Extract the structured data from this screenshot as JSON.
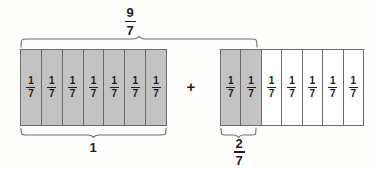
{
  "diagram": {
    "title_label": "9/7",
    "operator": "+",
    "total_brace": {
      "name": "total-span",
      "label_numerator": "9",
      "label_denominator": "7"
    },
    "bars": [
      {
        "name": "bar-left",
        "segments": 7,
        "shaded_count": 7,
        "cell_numerator": "1",
        "cell_denominator": "7",
        "brace_label": "1",
        "brace_label_type": "whole",
        "cells": [
          {
            "numerator": "1",
            "denominator": "7",
            "shaded": true
          },
          {
            "numerator": "1",
            "denominator": "7",
            "shaded": true
          },
          {
            "numerator": "1",
            "denominator": "7",
            "shaded": true
          },
          {
            "numerator": "1",
            "denominator": "7",
            "shaded": true
          },
          {
            "numerator": "1",
            "denominator": "7",
            "shaded": true
          },
          {
            "numerator": "1",
            "denominator": "7",
            "shaded": true
          },
          {
            "numerator": "1",
            "denominator": "7",
            "shaded": true
          }
        ]
      },
      {
        "name": "bar-right",
        "segments": 7,
        "shaded_count": 2,
        "cell_numerator": "1",
        "cell_denominator": "7",
        "brace_label_numerator": "2",
        "brace_label_denominator": "7",
        "brace_label_type": "fraction",
        "cells": [
          {
            "numerator": "1",
            "denominator": "7",
            "shaded": true
          },
          {
            "numerator": "1",
            "denominator": "7",
            "shaded": true
          },
          {
            "numerator": "1",
            "denominator": "7",
            "shaded": false
          },
          {
            "numerator": "1",
            "denominator": "7",
            "shaded": false
          },
          {
            "numerator": "1",
            "denominator": "7",
            "shaded": false
          },
          {
            "numerator": "1",
            "denominator": "7",
            "shaded": false
          },
          {
            "numerator": "1",
            "denominator": "7",
            "shaded": false
          }
        ]
      }
    ],
    "colors": {
      "shaded_fill": "#c3c3c3",
      "unshaded_fill": "#ffffff",
      "outline": "#6b6b6b",
      "brace_stroke": "#6e6e6e",
      "text": "#1f1f1f",
      "background": "#fdfdfc"
    }
  }
}
